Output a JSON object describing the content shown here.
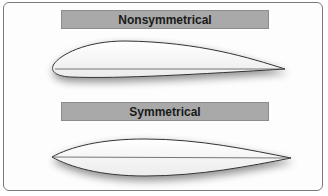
{
  "diagram": {
    "sections": [
      {
        "label": "Nonsymmetrical",
        "shape": "cambered-airfoil"
      },
      {
        "label": "Symmetrical",
        "shape": "symmetric-airfoil"
      }
    ],
    "colors": {
      "label_bar": "#a9a9a9",
      "outline": "#333333",
      "chord_line": "#555555",
      "frame": "#7a7a7a"
    }
  }
}
